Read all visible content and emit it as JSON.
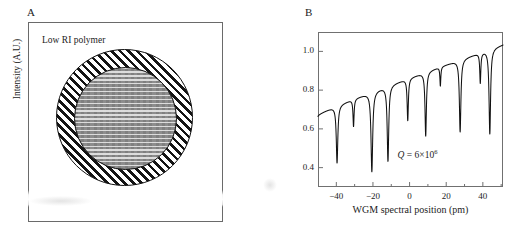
{
  "figure": {
    "panels": [
      {
        "letter": "A",
        "name": "schematic-panel",
        "box_label": "Low RI polymer",
        "elements": {
          "outer_ring_name": "low-ri-polymer-coating",
          "inner_disc_name": "microsphere-resonator-core"
        }
      },
      {
        "letter": "B",
        "name": "spectrum-panel"
      }
    ]
  },
  "chart_data": {
    "type": "line",
    "title": "",
    "xlabel": "WGM spectral position (pm)",
    "ylabel": "Intensity (A.U.)",
    "xlim": [
      -50,
      51
    ],
    "ylim": [
      0.3,
      1.1
    ],
    "xticks": [
      -40,
      -20,
      0,
      20,
      40
    ],
    "xtick_labels": [
      "−40",
      "−20",
      "0",
      "20",
      "40"
    ],
    "xminor_ticks": [
      -30,
      -10,
      10,
      30,
      50
    ],
    "yticks": [
      0.4,
      0.6,
      0.8,
      1.0
    ],
    "ytick_labels": [
      "0.4",
      "0.6",
      "0.8",
      "1.0"
    ],
    "grid": false,
    "legend": null,
    "annotations": [
      {
        "name": "q-factor-annotation",
        "text": "Q = 6×10⁶",
        "symbol": "Q",
        "operator": "=",
        "mantissa": "6×10",
        "exponent": "6",
        "x": 12,
        "y": 0.47
      }
    ],
    "baseline": {
      "y_at_xmin": 0.665,
      "y_at_xmax": 1.035,
      "shape": "monotonic rising, slightly concave"
    },
    "series": [
      {
        "name": "transmission",
        "color": "#111111",
        "linewidth": 1.1,
        "resonance_dips": [
          {
            "x": -39.6,
            "depth_y": 0.447,
            "baseline_y": 0.742,
            "width_pm": 1.0
          },
          {
            "x": -30.6,
            "depth_y": 0.617,
            "baseline_y": 0.757,
            "width_pm": 0.7
          },
          {
            "x": -20.6,
            "depth_y": 0.382,
            "baseline_y": 0.793,
            "width_pm": 1.1
          },
          {
            "x": -11.8,
            "depth_y": 0.447,
            "baseline_y": 0.835,
            "width_pm": 1.0
          },
          {
            "x": -1.0,
            "depth_y": 0.656,
            "baseline_y": 0.872,
            "width_pm": 0.8
          },
          {
            "x": 8.8,
            "depth_y": 0.578,
            "baseline_y": 0.908,
            "width_pm": 0.9
          },
          {
            "x": 16.8,
            "depth_y": 0.8,
            "baseline_y": 0.898,
            "width_pm": 0.6
          },
          {
            "x": 27.6,
            "depth_y": 0.6,
            "baseline_y": 0.972,
            "width_pm": 1.0
          },
          {
            "x": 38.6,
            "depth_y": 0.845,
            "baseline_y": 1.0,
            "width_pm": 0.7
          },
          {
            "x": 43.8,
            "depth_y": 0.585,
            "baseline_y": 1.022,
            "width_pm": 1.0
          }
        ]
      }
    ]
  },
  "colors": {
    "line": "#111111",
    "axis": "#707070",
    "text": "#1c1c1c",
    "core_fill": "#8d8d8d",
    "background": "#ffffff"
  }
}
